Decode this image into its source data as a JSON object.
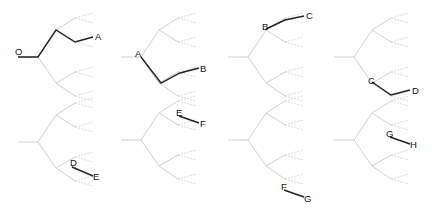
{
  "diagram": {
    "title": "",
    "colors": {
      "tree_edge": "#c8c8c8",
      "highlight": "#222222",
      "label": "#111111"
    },
    "tree_nodes_local": {
      "root": [
        18,
        57
      ],
      "n0": [
        38,
        57
      ],
      "n1u": [
        56,
        30
      ],
      "n1d": [
        56,
        83
      ],
      "n2uu": [
        75,
        18
      ],
      "n2ud": [
        75,
        42
      ],
      "n2du": [
        75,
        72
      ],
      "n2dd": [
        75,
        96
      ]
    },
    "panels": [
      {
        "id": "p1",
        "offset": [
          0,
          0
        ],
        "path": [
          [
            18,
            57
          ],
          [
            38,
            57
          ],
          [
            56,
            30
          ],
          [
            75,
            42
          ],
          [
            93,
            37
          ]
        ],
        "labels": [
          {
            "text": "O",
            "x": 15,
            "y": 55
          },
          {
            "text": "A",
            "x": 95,
            "y": 40
          }
        ]
      },
      {
        "id": "p2",
        "offset": [
          108,
          0
        ],
        "path": [
          [
            33,
            57
          ],
          [
            53,
            83
          ],
          [
            72,
            73
          ],
          [
            91,
            68
          ]
        ],
        "labels": [
          {
            "text": "A",
            "x": 27,
            "y": 57
          },
          {
            "text": "B",
            "x": 92,
            "y": 72
          }
        ]
      },
      {
        "id": "p3",
        "offset": [
          216,
          0
        ],
        "path": [
          [
            50,
            29
          ],
          [
            69,
            20
          ],
          [
            88,
            16
          ]
        ],
        "labels": [
          {
            "text": "B",
            "x": 46,
            "y": 30
          },
          {
            "text": "C",
            "x": 90,
            "y": 19
          }
        ]
      },
      {
        "id": "p4",
        "offset": [
          324,
          0
        ],
        "path": [
          [
            48,
            82
          ],
          [
            67,
            95
          ],
          [
            86,
            90
          ]
        ],
        "labels": [
          {
            "text": "C",
            "x": 44,
            "y": 84
          },
          {
            "text": "D",
            "x": 88,
            "y": 94
          }
        ]
      },
      {
        "id": "p5",
        "offset": [
          0,
          107
        ],
        "path": [
          [
            72,
            60
          ],
          [
            93,
            69
          ]
        ],
        "labels": [
          {
            "text": "D",
            "x": 70,
            "y": 59
          },
          {
            "text": "E",
            "x": 93,
            "y": 73
          }
        ]
      },
      {
        "id": "p6",
        "offset": [
          108,
          107
        ],
        "path": [
          [
            71,
            9
          ],
          [
            91,
            16
          ]
        ],
        "labels": [
          {
            "text": "E",
            "x": 68,
            "y": 9
          },
          {
            "text": "F",
            "x": 92,
            "y": 20
          }
        ]
      },
      {
        "id": "p7",
        "offset": [
          216,
          107
        ],
        "path": [
          [
            68,
            83
          ],
          [
            88,
            90
          ]
        ],
        "labels": [
          {
            "text": "F",
            "x": 65,
            "y": 83
          },
          {
            "text": "G",
            "x": 88,
            "y": 95
          }
        ]
      },
      {
        "id": "p8",
        "offset": [
          324,
          107
        ],
        "path": [
          [
            66,
            30
          ],
          [
            86,
            37
          ]
        ],
        "labels": [
          {
            "text": "G",
            "x": 62,
            "y": 30
          },
          {
            "text": "H",
            "x": 86,
            "y": 41
          }
        ]
      }
    ],
    "node_labels": [
      "O",
      "A",
      "B",
      "C",
      "D",
      "E",
      "F",
      "G",
      "H"
    ]
  }
}
